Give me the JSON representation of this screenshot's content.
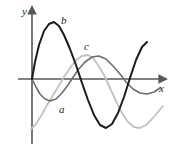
{
  "figure": {
    "type": "math-graph",
    "background": "#ffffff",
    "width": 172,
    "height": 152
  },
  "axes": {
    "x_label": "x",
    "y_label": "y",
    "axis_color": "#585858",
    "origin": {
      "x": 32,
      "y": 79
    },
    "x_axis": {
      "start_x": 18,
      "end_x": 164,
      "y": 79,
      "arrow": true
    },
    "y_axis": {
      "x": 32,
      "start_y": 144,
      "end_y": 10,
      "arrow": true
    }
  },
  "curves": [
    {
      "id": "a",
      "label": "a",
      "color": "#6e6e6e",
      "stroke_width": 1.5,
      "label_pos": {
        "x": 59,
        "y": 104
      },
      "description": "medium-gray sinusoid, starts at origin going down, trough near x=48"
    },
    {
      "id": "b",
      "label": "b",
      "color": "#1c1c1c",
      "stroke_width": 2.0,
      "label_pos": {
        "x": 61,
        "y": 15
      },
      "description": "dark sinusoid, large amplitude, crest near x=54 y=22, trough near x=100 y=128"
    },
    {
      "id": "c",
      "label": "c",
      "color": "#c2c2c2",
      "stroke_width": 1.8,
      "label_pos": {
        "x": 84,
        "y": 41
      },
      "description": "light-gray sinusoid, rises from lower-left, crest near x=80 y=55"
    }
  ],
  "chart_data": {
    "type": "line",
    "title": "",
    "xlabel": "x",
    "ylabel": "y",
    "grid": false,
    "legend": "inline-curve-labels",
    "xlim": [
      0,
      1
    ],
    "ylim": [
      -1.1,
      1.1
    ],
    "series": [
      {
        "name": "a",
        "color": "#6e6e6e",
        "points": [
          [
            32,
            79
          ],
          [
            36,
            87
          ],
          [
            40,
            94
          ],
          [
            45,
            99
          ],
          [
            50,
            101
          ],
          [
            56,
            99
          ],
          [
            62,
            93
          ],
          [
            68,
            85
          ],
          [
            72,
            79
          ],
          [
            78,
            70
          ],
          [
            85,
            62
          ],
          [
            92,
            57
          ],
          [
            99,
            56
          ],
          [
            106,
            59
          ],
          [
            113,
            66
          ],
          [
            120,
            74
          ],
          [
            126,
            82
          ],
          [
            133,
            89
          ],
          [
            140,
            93
          ],
          [
            147,
            94
          ],
          [
            154,
            92
          ],
          [
            160,
            88
          ]
        ]
      },
      {
        "name": "b",
        "color": "#1c1c1c",
        "points": [
          [
            32,
            79
          ],
          [
            35,
            62
          ],
          [
            39,
            45
          ],
          [
            44,
            31
          ],
          [
            49,
            24
          ],
          [
            54,
            22
          ],
          [
            59,
            26
          ],
          [
            64,
            35
          ],
          [
            70,
            49
          ],
          [
            76,
            65
          ],
          [
            82,
            83
          ],
          [
            88,
            100
          ],
          [
            94,
            115
          ],
          [
            100,
            125
          ],
          [
            106,
            128
          ],
          [
            112,
            124
          ],
          [
            118,
            113
          ],
          [
            124,
            97
          ],
          [
            130,
            78
          ],
          [
            136,
            60
          ],
          [
            142,
            47
          ],
          [
            147,
            42
          ]
        ]
      },
      {
        "name": "c",
        "color": "#c2c2c2",
        "points": [
          [
            31,
            129
          ],
          [
            36,
            124
          ],
          [
            41,
            116
          ],
          [
            46,
            107
          ],
          [
            52,
            97
          ],
          [
            58,
            87
          ],
          [
            64,
            77
          ],
          [
            70,
            68
          ],
          [
            76,
            60
          ],
          [
            82,
            56
          ],
          [
            88,
            55
          ],
          [
            93,
            58
          ],
          [
            98,
            65
          ],
          [
            104,
            75
          ],
          [
            110,
            88
          ],
          [
            116,
            101
          ],
          [
            122,
            113
          ],
          [
            128,
            122
          ],
          [
            134,
            127
          ],
          [
            140,
            128
          ],
          [
            146,
            125
          ],
          [
            152,
            119
          ],
          [
            158,
            112
          ],
          [
            163,
            106
          ]
        ]
      }
    ]
  }
}
